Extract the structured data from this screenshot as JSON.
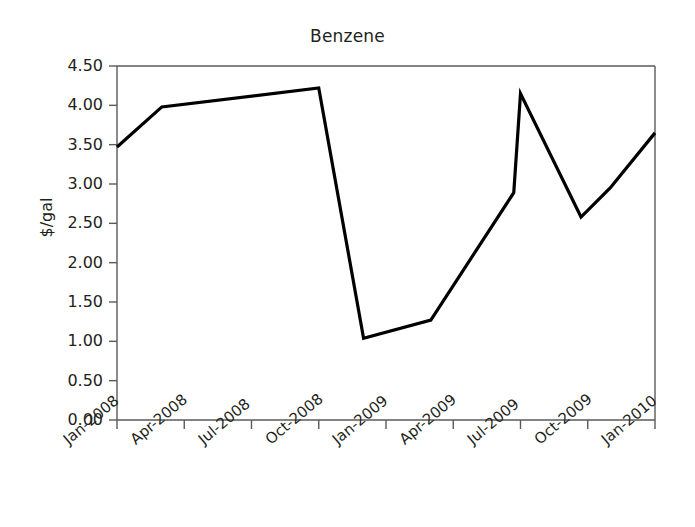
{
  "chart_data": {
    "type": "line",
    "title": "Benzene",
    "xlabel": "",
    "ylabel": "$/gal",
    "ylim": [
      0.0,
      4.5
    ],
    "ytick_labels": [
      "0.00",
      "0.50",
      "1.00",
      "1.50",
      "2.00",
      "2.50",
      "3.00",
      "3.50",
      "4.00",
      "4.50"
    ],
    "ytick_values": [
      0.0,
      0.5,
      1.0,
      1.5,
      2.0,
      2.5,
      3.0,
      3.5,
      4.0,
      4.5
    ],
    "xtick_labels": [
      "Jan-2008",
      "Apr-2008",
      "Jul-2008",
      "Oct-2008",
      "Jan-2009",
      "Apr-2009",
      "Jul-2009",
      "Oct-2009",
      "Jan-2010"
    ],
    "xtick_values": [
      0,
      3,
      6,
      9,
      12,
      15,
      18,
      21,
      24
    ],
    "xlim": [
      0,
      24
    ],
    "grid": false,
    "legend": "none",
    "series": [
      {
        "name": "Benzene price",
        "color": "#000000",
        "x": [
          0,
          2,
          9,
          11,
          14,
          17.7,
          18,
          20.7,
          22,
          24
        ],
        "values": [
          3.47,
          3.98,
          4.22,
          1.04,
          1.27,
          2.89,
          4.15,
          2.58,
          2.95,
          3.65
        ],
        "point_labels": [
          "Jan-2008",
          "Mar-2008",
          "Oct-2008",
          "Dec-2008",
          "Mar-2009",
          "Jun-2009",
          "Jul-2009",
          "Sep-2009",
          "Nov-2009",
          "Jan-2010"
        ]
      }
    ]
  },
  "axes": {
    "left_px": 117,
    "right_px": 655,
    "top_px": 66,
    "bottom_px": 420,
    "frame_color": "#5a5a5a",
    "line_width": 3.2
  }
}
